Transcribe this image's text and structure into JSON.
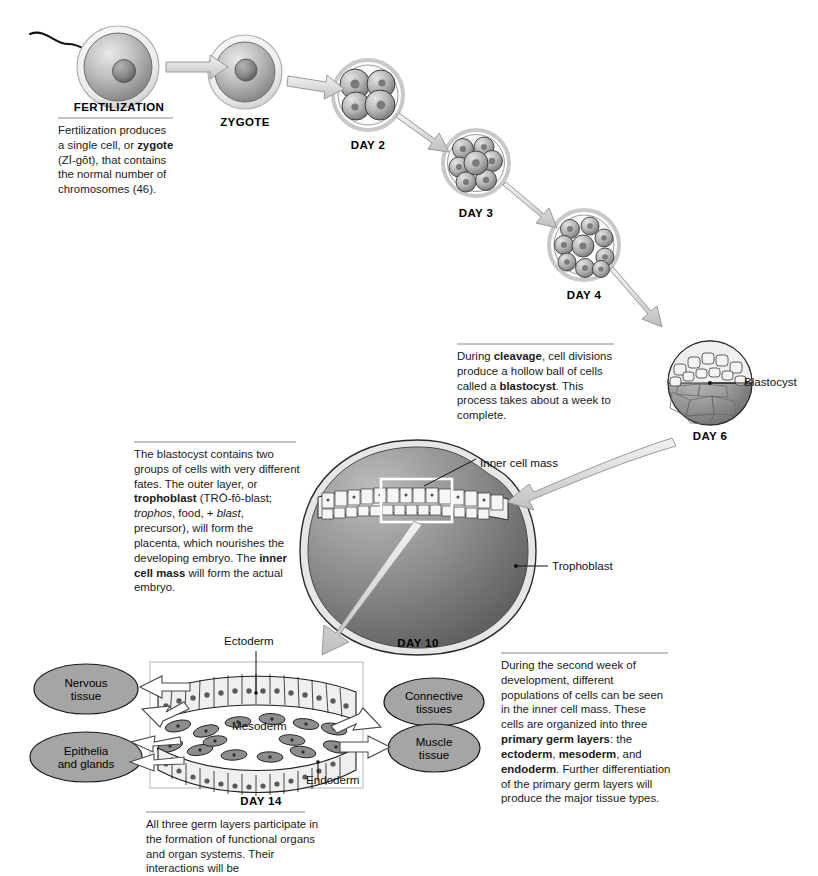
{
  "figure": {
    "title_hidden": "Stages of early human embryonic development",
    "background": "#ffffff"
  },
  "stages": [
    {
      "id": "fertilization",
      "label": "FERTILIZATION",
      "cx": 118,
      "cy": 67,
      "r": 41
    },
    {
      "id": "zygote",
      "label": "ZYGOTE",
      "cx": 245,
      "cy": 72,
      "r": 37
    },
    {
      "id": "day2",
      "label": "DAY 2",
      "cx": 368,
      "cy": 95,
      "r": 35
    },
    {
      "id": "day3",
      "label": "DAY 3",
      "cx": 476,
      "cy": 163,
      "r": 33
    },
    {
      "id": "day4",
      "label": "DAY 4",
      "cx": 584,
      "cy": 245,
      "r": 35
    },
    {
      "id": "day6",
      "label": "DAY 6",
      "cx": 710,
      "cy": 383,
      "r": 42
    },
    {
      "id": "day10",
      "label": "DAY 10",
      "cx": 418,
      "cy": 551,
      "r": 0
    },
    {
      "id": "day14",
      "label": "DAY 14",
      "cx": 261,
      "cy": 801,
      "r": 0
    }
  ],
  "callouts": {
    "fertilization": {
      "lines": [
        "Fertilization produces",
        "a single cell, or ",
        "(ZĪ-gōt), that contains",
        "the normal number of",
        "chromosomes (46)."
      ],
      "bold_terms": [
        "zygote"
      ]
    },
    "cleavage": {
      "text_segments": [
        {
          "t": "During ",
          "b": false
        },
        {
          "t": "cleavage",
          "b": true
        },
        {
          "t": ", cell divisions produce a hollow ball of cells called a ",
          "b": false
        },
        {
          "t": "blastocyst",
          "b": true
        },
        {
          "t": ". This process takes about a week to complete.",
          "b": false
        }
      ]
    },
    "blastocyst_desc": {
      "text_segments": [
        {
          "t": "The blastocyst contains two groups of cells with very different fates. The outer layer, or ",
          "b": false
        },
        {
          "t": "trophoblast",
          "b": true
        },
        {
          "t": " (TRŌ-fō-blast; ",
          "b": false
        },
        {
          "t": "trophos",
          "i": true
        },
        {
          "t": ", food, + ",
          "b": false
        },
        {
          "t": "blast",
          "i": true
        },
        {
          "t": ", precursor), will form the placenta, which nourishes the developing embryo. The ",
          "b": false
        },
        {
          "t": "inner cell mass",
          "b": true
        },
        {
          "t": " will form the actual embryo.",
          "b": false
        }
      ]
    },
    "second_week": {
      "text_segments": [
        {
          "t": "During the second week of development, different populations of cells can be seen in the inner cell mass. These cells are organized into three ",
          "b": false
        },
        {
          "t": "primary germ layers",
          "b": true
        },
        {
          "t": ": the ",
          "b": false
        },
        {
          "t": "ectoderm",
          "b": true
        },
        {
          "t": ", ",
          "b": false
        },
        {
          "t": "mesoderm",
          "b": true
        },
        {
          "t": ", and ",
          "b": false
        },
        {
          "t": "endoderm",
          "b": true
        },
        {
          "t": ". Further differentiation of the primary germ layers will produce the major tissue types.",
          "b": false
        }
      ]
    },
    "germ_layers_bottom": {
      "text": "All three germ layers participate in the formation of functional organs and organ systems. Their interactions will be"
    }
  },
  "leader_labels": {
    "blastocyst": "Blastocyst",
    "inner_cell_mass": "Inner cell mass",
    "trophoblast": "Trophoblast",
    "ectoderm": "Ectoderm",
    "mesoderm": "Mesoderm",
    "endoderm": "Endoderm"
  },
  "tissue_ovals": [
    {
      "id": "nervous",
      "lines": [
        "Nervous",
        "tissue"
      ],
      "cx": 86,
      "cy": 689,
      "rx": 52,
      "ry": 25
    },
    {
      "id": "epithelia",
      "lines": [
        "Epithelia",
        "and glands"
      ],
      "cx": 86,
      "cy": 757,
      "rx": 56,
      "ry": 25
    },
    {
      "id": "connective",
      "lines": [
        "Connective",
        "tissues"
      ],
      "cx": 434,
      "cy": 702,
      "rx": 50,
      "ry": 24
    },
    {
      "id": "muscle",
      "lines": [
        "Muscle",
        "tissue"
      ],
      "cx": 434,
      "cy": 748,
      "rx": 46,
      "ry": 24
    }
  ],
  "colors": {
    "oval_fill": "#a5a5a5",
    "oval_stroke": "#1a1a1a",
    "arrow_fill": "#e2e2e2",
    "arrow_stroke": "#8f8f8f",
    "cell_dark": "#6d6d6d",
    "cell_light": "#d8d8d8",
    "outline": "#1c1c1c",
    "rule": "#8a8a8a",
    "text": "#111111"
  },
  "counts": {
    "day2_cells": 4,
    "day3_cells": 12,
    "day4_cells": 16,
    "ectoderm_cells": 14,
    "endoderm_cells": 14,
    "mesoderm_cells": 18
  }
}
